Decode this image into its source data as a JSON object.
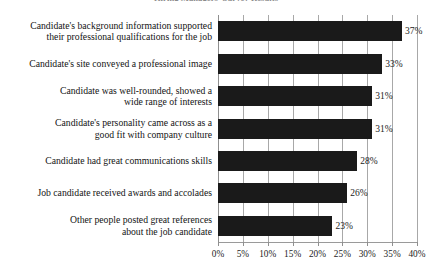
{
  "chart_data": {
    "type": "bar",
    "orientation": "horizontal",
    "title": "Hiring Managers' Survey Results",
    "xlabel": "",
    "ylabel": "",
    "xlim": [
      0,
      40
    ],
    "xticks": [
      "0%",
      "5%",
      "10%",
      "15%",
      "20%",
      "25%",
      "30%",
      "35%",
      "40%"
    ],
    "xtick_values": [
      0,
      5,
      10,
      15,
      20,
      25,
      30,
      35,
      40
    ],
    "grid": true,
    "legend": "none",
    "categories": [
      "Candidate's background information supported\ntheir professional qualifications for the job",
      "Candidate's site conveyed a professional image",
      "Candidate was well-rounded, showed a\nwide range of interests",
      "Candidate's personality came across as a\ngood fit with company culture",
      "Candidate had great communications skills",
      "Job candidate received awards and accolades",
      "Other people posted great references\nabout the job candidate"
    ],
    "values": [
      37,
      33,
      31,
      31,
      28,
      26,
      23
    ],
    "data_labels": [
      "37%",
      "33%",
      "31%",
      "31%",
      "28%",
      "26%",
      "23%"
    ],
    "bar_color": "#1a1a1a",
    "grid_color": "#a8a8a8",
    "background": "#ffffff"
  }
}
